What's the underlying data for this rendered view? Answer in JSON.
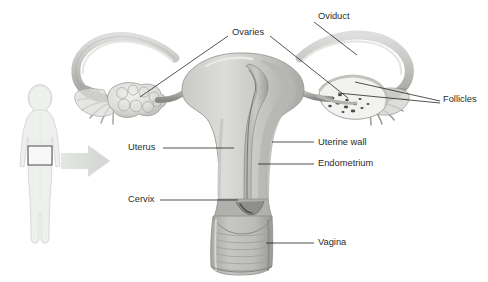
{
  "diagram": {
    "background_color": "#ffffff",
    "label_color": "#2b2b2b",
    "leader_line_color": "#1a1a1a",
    "organ_fill_light": "#d9d9d7",
    "organ_fill_mid": "#b9b9b6",
    "organ_fill_dark": "#9a9a97",
    "organ_outline": "#8a8a87",
    "silhouette_fill": "#eef0ee",
    "silhouette_outline": "#d5d8d5",
    "arrow_fill": "#dcdedc",
    "highlight_box_outline": "#4a4a4a"
  },
  "labels": [
    {
      "id": "ovaries",
      "text": "Ovaries",
      "x": 232,
      "y": 33,
      "anchor": "start"
    },
    {
      "id": "oviduct",
      "text": "Oviduct",
      "x": 318,
      "y": 17,
      "anchor": "start"
    },
    {
      "id": "follicles",
      "text": "Follicles",
      "x": 443,
      "y": 100,
      "anchor": "start"
    },
    {
      "id": "uterus",
      "text": "Uterus",
      "x": 128,
      "y": 148,
      "anchor": "start"
    },
    {
      "id": "uterine-wall",
      "text": "Uterine wall",
      "x": 318,
      "y": 143,
      "anchor": "start"
    },
    {
      "id": "endometrium",
      "text": "Endometrium",
      "x": 318,
      "y": 164,
      "anchor": "start"
    },
    {
      "id": "cervix",
      "text": "Cervix",
      "x": 128,
      "y": 200,
      "anchor": "start"
    },
    {
      "id": "vagina",
      "text": "Vagina",
      "x": 318,
      "y": 243,
      "anchor": "start"
    }
  ],
  "leader_lines": [
    {
      "id": "ovaries-left",
      "points": "140,97 228,36"
    },
    {
      "id": "ovaries-right",
      "points": "270,36 348,98"
    },
    {
      "id": "oviduct",
      "points": "314,22 357,55"
    },
    {
      "id": "follicles-a",
      "points": "355,82 440,101"
    },
    {
      "id": "follicles-b",
      "points": "338,93 440,103"
    },
    {
      "id": "uterus",
      "points": "163,148 234,148"
    },
    {
      "id": "uterine-wall",
      "points": "272,142 314,142"
    },
    {
      "id": "endometrium",
      "points": "258,164 314,164"
    },
    {
      "id": "cervix",
      "points": "160,200 238,200"
    },
    {
      "id": "vagina",
      "points": "266,243 314,243"
    }
  ],
  "inset_figure": {
    "name": "human-female-silhouette",
    "highlight_box": {
      "x": 28,
      "y": 146,
      "width": 24,
      "height": 19
    },
    "arrow": {
      "from_x": 60,
      "to_x": 110,
      "center_y": 161
    }
  },
  "anatomy_parts": [
    "left-oviduct",
    "left-fimbriae",
    "left-ovary",
    "uterus-body",
    "uterine-wall",
    "endometrium",
    "cervix",
    "vagina",
    "right-oviduct",
    "right-fimbriae",
    "right-ovary",
    "follicles"
  ]
}
